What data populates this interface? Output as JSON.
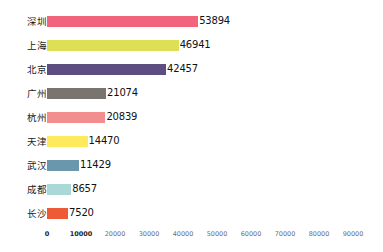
{
  "chart_data": {
    "type": "bar",
    "orientation": "horizontal",
    "title": "",
    "subtitle": "",
    "xlabel": "",
    "ylabel": "",
    "categories": [
      "深圳",
      "上海",
      "北京",
      "广州",
      "杭州",
      "天津",
      "武汉",
      "成都",
      "长沙"
    ],
    "values": [
      53894,
      46941,
      42457,
      21074,
      20839,
      14470,
      11429,
      8657,
      7520
    ],
    "value_labels": [
      "53894",
      "46941",
      "42457",
      "21074",
      "20839",
      "14470",
      "11429",
      "8657",
      "7520"
    ],
    "colors": [
      "#f1647c",
      "#dde055",
      "#5d4d80",
      "#7a7470",
      "#f28e8e",
      "#ffe95c",
      "#6b97ad",
      "#a9d8d6",
      "#ee5a35"
    ],
    "xlim": [
      0,
      95000
    ],
    "xticks": [
      0,
      10000,
      20000,
      30000,
      40000,
      50000,
      60000,
      70000,
      80000,
      90000
    ],
    "xtick_labels": [
      "0",
      "10000",
      "20000",
      "30000",
      "40000",
      "50000",
      "60000",
      "70000",
      "80000",
      "90000"
    ],
    "xtick_emphasis": [
      true,
      true,
      false,
      false,
      false,
      false,
      false,
      false,
      false,
      false
    ],
    "grid": false,
    "legend": false,
    "background_color": "#ffffff",
    "value_label_color": "#111111",
    "category_label_color": "#1a1a1a",
    "tick_label_color": "#6e6e6e"
  },
  "layout": {
    "axis_origin_x": 47,
    "px_per_unit": 0.002805,
    "row_pitch": 24,
    "first_row_top": 10,
    "bar_height": 11
  }
}
